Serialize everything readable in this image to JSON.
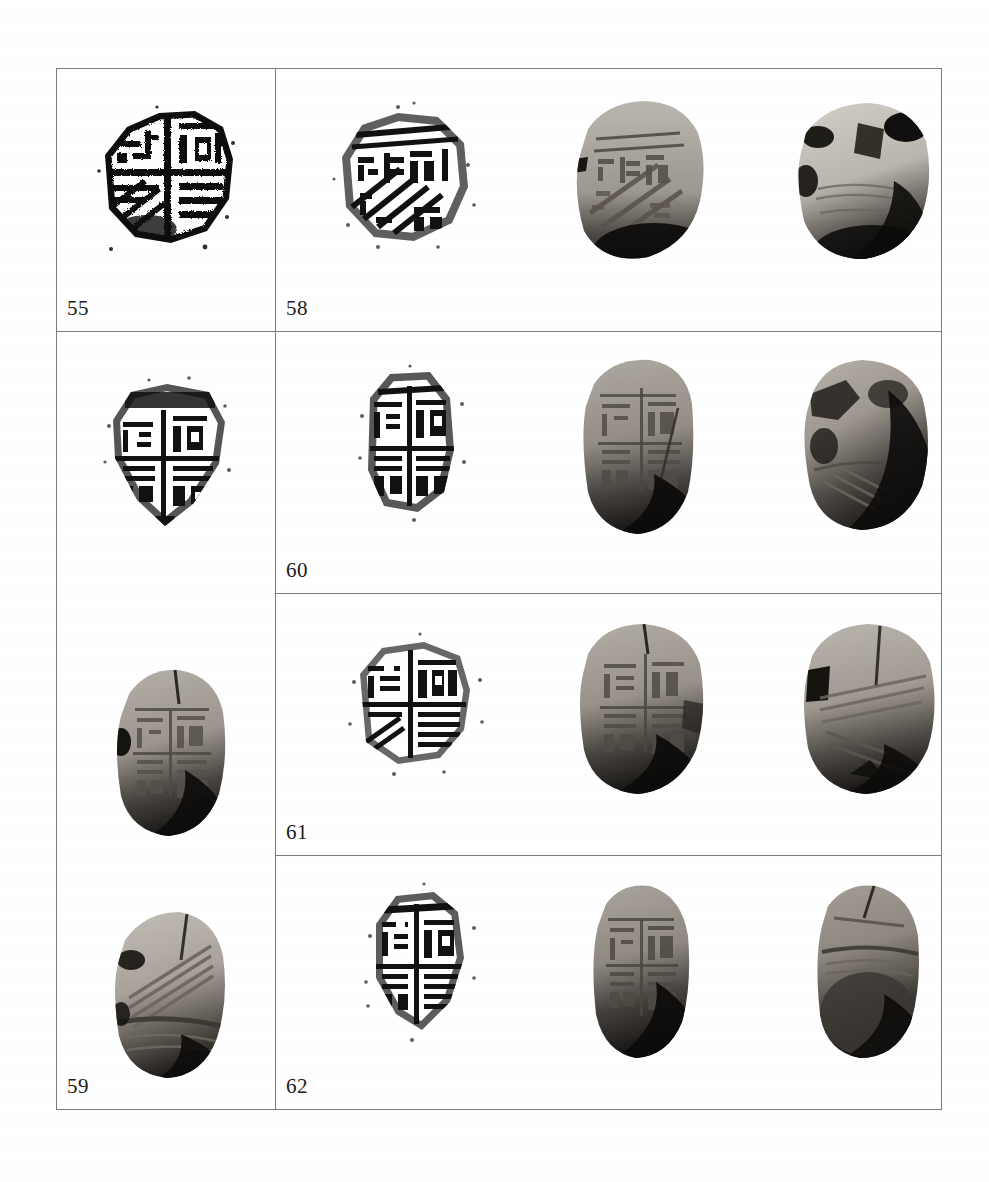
{
  "plate": {
    "kind": "archaeological-photo-plate",
    "description": "Plate of ancient clay seal impressions (bullae): ink rubbings and photographs of obverse and reverse",
    "frame_color": "#7b7b7b",
    "background_color": "#ffffff",
    "columns": 4,
    "cells": [
      {
        "id": "cell-55",
        "label": "55",
        "figures": [
          {
            "name": "rubbing-55",
            "type": "rubbing",
            "column": 1,
            "caption_glyphs": "quadripartite seal impression rubbing, high contrast black ink"
          }
        ]
      },
      {
        "id": "cell-58",
        "label": "58",
        "figures": [
          {
            "name": "rubbing-58",
            "type": "rubbing",
            "column": 2,
            "caption_glyphs": "quadripartite seal impression rubbing with diagonal hatching"
          },
          {
            "name": "photo-58-obverse",
            "type": "photograph-obverse",
            "column": 3,
            "caption_glyphs": "clay bulla, inscribed face, oval"
          },
          {
            "name": "photo-58-reverse",
            "type": "photograph-reverse",
            "column": 4,
            "caption_glyphs": "clay bulla, reverse with string impressions"
          }
        ]
      },
      {
        "id": "cell-59",
        "label": "59",
        "figures": [
          {
            "name": "rubbing-59",
            "type": "rubbing",
            "column": 1,
            "caption_glyphs": "pointed seal impression rubbing, dense script"
          },
          {
            "name": "photo-59-obverse",
            "type": "photograph-obverse",
            "column": 1,
            "caption_glyphs": "clay bulla, inscribed face, tall oval"
          },
          {
            "name": "photo-59-reverse",
            "type": "photograph-reverse",
            "column": 1,
            "caption_glyphs": "clay bulla, reverse with diagonal string marks"
          }
        ]
      },
      {
        "id": "cell-60",
        "label": "60",
        "figures": [
          {
            "name": "rubbing-60",
            "type": "rubbing",
            "column": 2,
            "caption_glyphs": "narrow seal impression rubbing, vertical split"
          },
          {
            "name": "photo-60-obverse",
            "type": "photograph-obverse",
            "column": 3,
            "caption_glyphs": "clay bulla, inscribed face, elongated"
          },
          {
            "name": "photo-60-reverse",
            "type": "photograph-reverse",
            "column": 4,
            "caption_glyphs": "clay bulla, reverse, chipped edge"
          }
        ]
      },
      {
        "id": "cell-61",
        "label": "61",
        "figures": [
          {
            "name": "rubbing-61",
            "type": "rubbing",
            "column": 2,
            "caption_glyphs": "quadripartite seal impression rubbing, clear frame"
          },
          {
            "name": "photo-61-obverse",
            "type": "photograph-obverse",
            "column": 3,
            "caption_glyphs": "clay bulla, inscribed face, cracked"
          },
          {
            "name": "photo-61-reverse",
            "type": "photograph-reverse",
            "column": 4,
            "caption_glyphs": "clay bulla, reverse with fibre impressions"
          }
        ]
      },
      {
        "id": "cell-62",
        "label": "62",
        "figures": [
          {
            "name": "rubbing-62",
            "type": "rubbing",
            "column": 2,
            "caption_glyphs": "seal impression rubbing, pointed lower edge"
          },
          {
            "name": "photo-62-obverse",
            "type": "photograph-obverse",
            "column": 3,
            "caption_glyphs": "clay bulla, inscribed face, narrow oval"
          },
          {
            "name": "photo-62-reverse",
            "type": "photograph-reverse",
            "column": 4,
            "caption_glyphs": "clay bulla, reverse, smooth with ridge"
          }
        ]
      }
    ]
  }
}
